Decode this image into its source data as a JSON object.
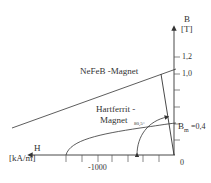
{
  "diagram": {
    "type": "magnet-demagnetization-curves",
    "axes": {
      "y": {
        "name": "B",
        "unit": "[T]",
        "ticks": [
          "1,2",
          "1,0"
        ]
      },
      "x": {
        "name": "H",
        "unit": "[kA/m]",
        "ticks": [
          "-1000"
        ]
      },
      "origin_label": "0"
    },
    "curves": [
      {
        "name": "NeFeB -Magnet"
      },
      {
        "name_line1": "Hartferrit -",
        "name_line2": "Magnet"
      }
    ],
    "annotations": {
      "angle": "80,5°",
      "bm_symbol": "B",
      "bm_subscript": "m",
      "bm_value": "=0,4"
    },
    "colors": {
      "line": "#333333",
      "background": "#ffffff"
    }
  }
}
